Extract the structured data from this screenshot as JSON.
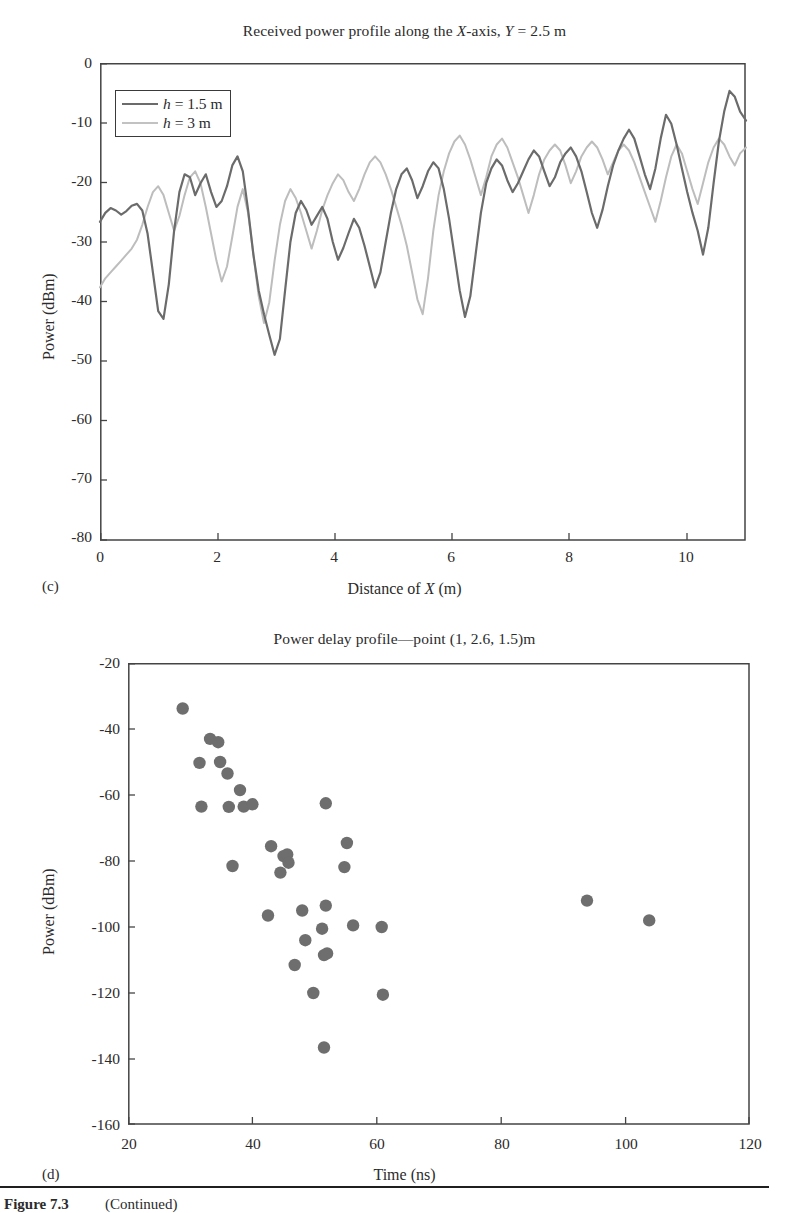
{
  "figure": {
    "caption_label": "Figure 7.3",
    "caption_note": "(Continued)"
  },
  "panel_c": {
    "letter": "(c)",
    "title": "Received power profile along the X-axis, Y = 2.5 m",
    "xlabel": "Distance of X (m)",
    "ylabel": "Power (dBm)",
    "legend": [
      {
        "label": "h = 1.5 m",
        "color": "#6b6b6b"
      },
      {
        "label": "h = 3 m",
        "color": "#bdbdbd"
      }
    ]
  },
  "panel_d": {
    "letter": "(d)",
    "title": "Power delay profile—point  (1, 2.6, 1.5)m",
    "xlabel": "Time (ns)",
    "ylabel": "Power (dBm)"
  },
  "chart_data": [
    {
      "type": "line",
      "panel": "(c)",
      "title": "Received power profile along the X-axis, Y = 2.5 m",
      "xlabel": "Distance of X (m)",
      "ylabel": "Power (dBm)",
      "xlim": [
        0,
        11
      ],
      "ylim": [
        -80,
        0
      ],
      "xticks": [
        0,
        2,
        4,
        6,
        8,
        10
      ],
      "yticks": [
        0,
        -10,
        -20,
        -30,
        -40,
        -50,
        -60,
        -70,
        -80
      ],
      "grid": false,
      "legend_position": "upper-left",
      "series": [
        {
          "name": "h = 1.5 m",
          "color": "#6b6b6b",
          "x": [
            0.0,
            0.09,
            0.18,
            0.27,
            0.36,
            0.45,
            0.54,
            0.63,
            0.72,
            0.81,
            0.9,
            0.99,
            1.08,
            1.17,
            1.26,
            1.35,
            1.44,
            1.53,
            1.62,
            1.71,
            1.8,
            1.89,
            1.98,
            2.07,
            2.16,
            2.25,
            2.34,
            2.43,
            2.52,
            2.61,
            2.7,
            2.79,
            2.88,
            2.97,
            3.06,
            3.15,
            3.24,
            3.33,
            3.42,
            3.51,
            3.6,
            3.69,
            3.78,
            3.87,
            3.96,
            4.05,
            4.14,
            4.23,
            4.32,
            4.41,
            4.5,
            4.59,
            4.68,
            4.77,
            4.86,
            4.95,
            5.04,
            5.13,
            5.22,
            5.31,
            5.4,
            5.49,
            5.58,
            5.67,
            5.76,
            5.85,
            5.94,
            6.03,
            6.12,
            6.21,
            6.3,
            6.39,
            6.48,
            6.57,
            6.66,
            6.75,
            6.84,
            6.93,
            7.02,
            7.11,
            7.2,
            7.29,
            7.38,
            7.47,
            7.56,
            7.65,
            7.74,
            7.83,
            7.92,
            8.01,
            8.1,
            8.19,
            8.28,
            8.37,
            8.46,
            8.55,
            8.64,
            8.73,
            8.82,
            8.91,
            9.0,
            9.09,
            9.18,
            9.27,
            9.36,
            9.45,
            9.54,
            9.63,
            9.72,
            9.81,
            9.9,
            9.99,
            10.08,
            10.17,
            10.26,
            10.35,
            10.44,
            10.53,
            10.62,
            10.71,
            10.8,
            10.89,
            11.0
          ],
          "y": [
            -46.5,
            -45.0,
            -44.2,
            -44.6,
            -45.3,
            -44.7,
            -43.8,
            -43.5,
            -44.6,
            -48.5,
            -55.0,
            -61.5,
            -62.8,
            -57.0,
            -48.0,
            -41.5,
            -38.5,
            -39.0,
            -42.0,
            -40.0,
            -38.5,
            -41.5,
            -44.0,
            -43.0,
            -40.5,
            -37.0,
            -35.5,
            -38.0,
            -44.5,
            -52.0,
            -58.0,
            -62.0,
            -65.5,
            -68.8,
            -66.0,
            -58.0,
            -50.0,
            -45.0,
            -43.0,
            -44.5,
            -47.0,
            -45.5,
            -44.0,
            -46.0,
            -50.0,
            -53.0,
            -51.0,
            -48.5,
            -46.0,
            -47.5,
            -50.5,
            -54.0,
            -57.5,
            -55.0,
            -50.0,
            -45.0,
            -41.0,
            -38.5,
            -37.5,
            -39.5,
            -42.5,
            -40.5,
            -38.0,
            -36.5,
            -37.5,
            -41.0,
            -46.0,
            -52.0,
            -58.0,
            -62.5,
            -59.0,
            -52.0,
            -45.0,
            -40.0,
            -37.5,
            -36.0,
            -37.0,
            -39.5,
            -41.5,
            -40.0,
            -38.0,
            -36.5,
            -35.0,
            -36.0,
            -38.5,
            -41.0,
            -39.5,
            -37.0,
            -35.5,
            -34.5,
            -36.0,
            -38.5,
            -42.0,
            -45.5,
            -48.0,
            -45.0,
            -41.0,
            -37.5,
            -35.0,
            -33.0,
            -31.5,
            -33.0,
            -36.0,
            -39.0,
            -41.5,
            -38.0,
            -33.0,
            -29.0,
            -30.5,
            -34.0,
            -38.0,
            -42.0,
            -45.5,
            -48.5,
            -52.0,
            -47.5,
            -40.0,
            -33.0,
            -28.0,
            -24.5,
            -25.5,
            -28.0,
            -31.0,
            -29.0
          ],
          "description": "Dark gray trace, fast multipath fading with overall rising trend from about -46 dBm at x=0 to peaks near -3 dBm around x=9.8; deepest null about -69 dBm near x=2."
        },
        {
          "name": "h = 3 m",
          "color": "#bdbdbd",
          "x": [
            0.0,
            0.09,
            0.18,
            0.27,
            0.36,
            0.45,
            0.54,
            0.63,
            0.72,
            0.81,
            0.9,
            0.99,
            1.08,
            1.17,
            1.26,
            1.35,
            1.44,
            1.53,
            1.62,
            1.71,
            1.8,
            1.89,
            1.98,
            2.07,
            2.16,
            2.25,
            2.34,
            2.43,
            2.52,
            2.61,
            2.7,
            2.79,
            2.88,
            2.97,
            3.06,
            3.15,
            3.24,
            3.33,
            3.42,
            3.51,
            3.6,
            3.69,
            3.78,
            3.87,
            3.96,
            4.05,
            4.14,
            4.23,
            4.32,
            4.41,
            4.5,
            4.59,
            4.68,
            4.77,
            4.86,
            4.95,
            5.04,
            5.13,
            5.22,
            5.31,
            5.4,
            5.49,
            5.58,
            5.67,
            5.76,
            5.85,
            5.94,
            6.03,
            6.12,
            6.21,
            6.3,
            6.39,
            6.48,
            6.57,
            6.66,
            6.75,
            6.84,
            6.93,
            7.02,
            7.11,
            7.2,
            7.29,
            7.38,
            7.47,
            7.56,
            7.65,
            7.74,
            7.83,
            7.92,
            8.01,
            8.1,
            8.19,
            8.28,
            8.37,
            8.46,
            8.55,
            8.64,
            8.73,
            8.82,
            8.91,
            9.0,
            9.09,
            9.18,
            9.27,
            9.36,
            9.45,
            9.54,
            9.63,
            9.72,
            9.81,
            9.9,
            9.99,
            10.08,
            10.17,
            10.26,
            10.35,
            10.44,
            10.53,
            10.62,
            10.71,
            10.8,
            10.89,
            11.0
          ],
          "y": [
            -57.5,
            -56.0,
            -55.0,
            -54.0,
            -53.0,
            -52.0,
            -51.0,
            -49.5,
            -47.0,
            -44.0,
            -41.5,
            -40.5,
            -42.0,
            -45.0,
            -48.0,
            -45.5,
            -42.0,
            -39.0,
            -38.0,
            -40.0,
            -44.0,
            -48.5,
            -53.0,
            -56.5,
            -54.0,
            -49.0,
            -44.0,
            -41.0,
            -45.0,
            -52.0,
            -59.0,
            -63.5,
            -60.0,
            -53.0,
            -47.0,
            -43.0,
            -41.0,
            -42.5,
            -45.0,
            -48.0,
            -51.0,
            -48.0,
            -44.5,
            -42.0,
            -40.0,
            -38.5,
            -39.5,
            -41.5,
            -43.0,
            -41.0,
            -38.5,
            -36.5,
            -35.5,
            -36.5,
            -38.5,
            -41.0,
            -44.0,
            -47.0,
            -50.5,
            -55.0,
            -59.5,
            -62.0,
            -56.0,
            -48.0,
            -42.0,
            -38.0,
            -35.0,
            -33.0,
            -32.0,
            -33.5,
            -36.0,
            -39.0,
            -42.0,
            -39.0,
            -35.5,
            -33.5,
            -32.5,
            -34.0,
            -36.5,
            -39.0,
            -42.0,
            -45.0,
            -42.0,
            -38.5,
            -36.0,
            -34.5,
            -33.5,
            -34.5,
            -37.0,
            -40.0,
            -38.0,
            -35.5,
            -34.0,
            -33.0,
            -34.0,
            -36.0,
            -38.5,
            -36.5,
            -34.5,
            -33.5,
            -34.5,
            -36.5,
            -39.0,
            -41.5,
            -44.0,
            -46.5,
            -43.0,
            -39.0,
            -35.5,
            -33.5,
            -35.0,
            -38.0,
            -41.0,
            -43.5,
            -40.0,
            -36.5,
            -34.0,
            -32.5,
            -33.5,
            -35.5,
            -37.0,
            -35.0,
            -34.0
          ],
          "description": "Light gray trace, similar fading pattern but starting lower near -58 dBm and flattening around -33 to -40 dBm beyond x=6; ends near -34 dBm."
        }
      ]
    },
    {
      "type": "scatter",
      "panel": "(d)",
      "title": "Power delay profile—point  (1, 2.6, 1.5)m",
      "xlabel": "Time (ns)",
      "ylabel": "Power (dBm)",
      "xlim": [
        20,
        120
      ],
      "ylim": [
        -160,
        -20
      ],
      "xticks": [
        20,
        40,
        60,
        80,
        100,
        120
      ],
      "yticks": [
        -20,
        -40,
        -60,
        -80,
        -100,
        -120,
        -140,
        -160
      ],
      "grid": false,
      "marker_color": "#6e6e6e",
      "points": [
        {
          "x": 28.8,
          "y": -33.8
        },
        {
          "x": 31.5,
          "y": -50.3
        },
        {
          "x": 33.2,
          "y": -43.0
        },
        {
          "x": 34.5,
          "y": -44.0
        },
        {
          "x": 34.8,
          "y": -50.0
        },
        {
          "x": 31.8,
          "y": -63.5
        },
        {
          "x": 36.0,
          "y": -53.5
        },
        {
          "x": 36.2,
          "y": -63.6
        },
        {
          "x": 38.0,
          "y": -58.5
        },
        {
          "x": 38.6,
          "y": -63.5
        },
        {
          "x": 36.8,
          "y": -81.5
        },
        {
          "x": 40.0,
          "y": -62.8
        },
        {
          "x": 43.0,
          "y": -75.5
        },
        {
          "x": 45.0,
          "y": -78.5
        },
        {
          "x": 45.6,
          "y": -78.0
        },
        {
          "x": 45.8,
          "y": -80.5
        },
        {
          "x": 44.5,
          "y": -83.5
        },
        {
          "x": 42.5,
          "y": -96.5
        },
        {
          "x": 51.8,
          "y": -62.5
        },
        {
          "x": 55.2,
          "y": -74.5
        },
        {
          "x": 54.8,
          "y": -81.8
        },
        {
          "x": 48.0,
          "y": -95.0
        },
        {
          "x": 51.8,
          "y": -93.5
        },
        {
          "x": 48.5,
          "y": -104.0
        },
        {
          "x": 51.2,
          "y": -100.5
        },
        {
          "x": 51.5,
          "y": -108.5
        },
        {
          "x": 52.0,
          "y": -108.0
        },
        {
          "x": 46.8,
          "y": -111.5
        },
        {
          "x": 49.8,
          "y": -120.0
        },
        {
          "x": 51.5,
          "y": -136.5
        },
        {
          "x": 56.2,
          "y": -99.5
        },
        {
          "x": 60.8,
          "y": -100.0
        },
        {
          "x": 61.0,
          "y": -120.5
        },
        {
          "x": 93.8,
          "y": -92.0
        },
        {
          "x": 103.8,
          "y": -98.0
        }
      ],
      "description": "Scattered multipath arrivals: strongest component about -34 dBm at 29 ns, decaying with delay; two late arrivals near 94 ns (-92 dBm) and 104 ns (-98 dBm)."
    }
  ]
}
